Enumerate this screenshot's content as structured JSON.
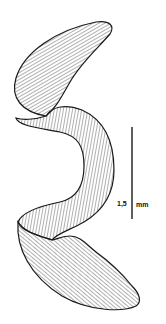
{
  "figure": {
    "scale_bar": {
      "value": "1,5",
      "unit": "mm"
    },
    "colors": {
      "background": "#ffffff",
      "ink": "#1a1a1a",
      "hatch": "#3a3a3a"
    }
  }
}
